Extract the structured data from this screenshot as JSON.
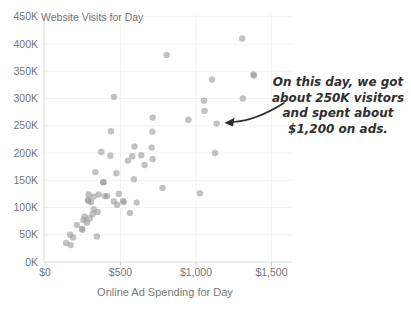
{
  "chart_data": {
    "type": "scatter",
    "title": "Website Visits for Day",
    "xlabel": "Online Ad Spending for Day",
    "ylabel": "",
    "x_tick_labels": [
      "$0",
      "$500",
      "$1,000",
      "$1,500"
    ],
    "x_tick_values": [
      0,
      500,
      1000,
      1500
    ],
    "y_tick_labels": [
      "0K",
      "50K",
      "100K",
      "150K",
      "200K",
      "250K",
      "300K",
      "350K",
      "400K",
      "450K"
    ],
    "y_tick_values": [
      0,
      50,
      100,
      150,
      200,
      250,
      300,
      350,
      400,
      450
    ],
    "xlim": [
      0,
      1640
    ],
    "ylim": [
      0,
      450
    ],
    "grid": true,
    "visits_units": "thousands",
    "points": [
      [
        139,
        35
      ],
      [
        170,
        31
      ],
      [
        166,
        50
      ],
      [
        187,
        45
      ],
      [
        211,
        68
      ],
      [
        245,
        61
      ],
      [
        248,
        59
      ],
      [
        255,
        77
      ],
      [
        278,
        72
      ],
      [
        262,
        83
      ],
      [
        295,
        80
      ],
      [
        315,
        88
      ],
      [
        344,
        47
      ],
      [
        322,
        97
      ],
      [
        349,
        92
      ],
      [
        285,
        114
      ],
      [
        288,
        112
      ],
      [
        289,
        124
      ],
      [
        305,
        110
      ],
      [
        322,
        120
      ],
      [
        333,
        165
      ],
      [
        355,
        124
      ],
      [
        373,
        202
      ],
      [
        385,
        147
      ],
      [
        388,
        146
      ],
      [
        396,
        121
      ],
      [
        411,
        121
      ],
      [
        433,
        195
      ],
      [
        437,
        240
      ],
      [
        456,
        111
      ],
      [
        457,
        303
      ],
      [
        473,
        163
      ],
      [
        478,
        105
      ],
      [
        489,
        125
      ],
      [
        518,
        112
      ],
      [
        521,
        110
      ],
      [
        549,
        186
      ],
      [
        562,
        90
      ],
      [
        578,
        194
      ],
      [
        589,
        152
      ],
      [
        593,
        212
      ],
      [
        607,
        109
      ],
      [
        638,
        196
      ],
      [
        660,
        178
      ],
      [
        706,
        210
      ],
      [
        713,
        189
      ],
      [
        713,
        265
      ],
      [
        711,
        239
      ],
      [
        778,
        136
      ],
      [
        806,
        380
      ],
      [
        950,
        261
      ],
      [
        1026,
        126
      ],
      [
        1053,
        296
      ],
      [
        1056,
        277
      ],
      [
        1106,
        335
      ],
      [
        1126,
        200
      ],
      [
        1137,
        254
      ],
      [
        1306,
        410
      ],
      [
        1310,
        300
      ],
      [
        1384,
        342
      ],
      [
        1381,
        344
      ]
    ],
    "annotation": {
      "lines": [
        "On this day, we got",
        "about 250K visitors",
        "and spent about",
        "$1,200 on ads."
      ],
      "target_point": [
        1137,
        254
      ]
    }
  },
  "colors": {
    "point": "#999999",
    "point_opacity": "0.6",
    "axis_line": "#d9d9d9",
    "gridline": "#f2f2f2",
    "tick_text": "#777777",
    "annotation_text": "#2f2f2f"
  }
}
